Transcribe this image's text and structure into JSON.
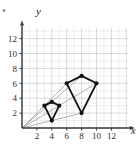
{
  "figure": {
    "corner_dot": "bullet-marker",
    "axis": {
      "x_label": "x",
      "y_label": "y",
      "x_ticks": [
        2,
        4,
        6,
        8,
        10,
        12
      ],
      "y_ticks": [
        2,
        4,
        6,
        8,
        10,
        12
      ],
      "x_range": [
        0,
        14
      ],
      "y_range": [
        0,
        13.5
      ],
      "grid": true,
      "grid_minor_step": 1,
      "grid_major_step": 2,
      "axis_color": "#3a3a3a",
      "grid_color": "#d8dde4",
      "grid_major_color": "#c3cad3",
      "ray_color": "#9a9a9a",
      "shape_color": "#111111"
    }
  },
  "chart_data": {
    "type": "scatter",
    "title": "",
    "xlabel": "x",
    "ylabel": "y",
    "xlim": [
      0,
      14
    ],
    "ylim": [
      0,
      13.5
    ],
    "grid": true,
    "legend": "none",
    "series": [
      {
        "name": "preimage-quadrilateral",
        "closed": true,
        "points": [
          [
            3,
            3
          ],
          [
            4,
            3.5
          ],
          [
            5,
            3
          ],
          [
            4,
            1
          ]
        ],
        "marker": "filled-circle"
      },
      {
        "name": "image-quadrilateral",
        "closed": true,
        "points": [
          [
            6,
            6
          ],
          [
            8,
            7
          ],
          [
            10,
            6
          ],
          [
            8,
            2
          ]
        ],
        "marker": "filled-circle"
      }
    ],
    "rays_from_origin": [
      {
        "name": "ray-to-6-6",
        "from": [
          0,
          0
        ],
        "to": [
          6,
          6
        ]
      },
      {
        "name": "ray-to-8-7",
        "from": [
          0,
          0
        ],
        "to": [
          8,
          7
        ]
      },
      {
        "name": "ray-to-10-6",
        "from": [
          0,
          0
        ],
        "to": [
          10,
          6
        ]
      },
      {
        "name": "ray-to-8-2",
        "from": [
          0,
          0
        ],
        "to": [
          8,
          2
        ]
      }
    ],
    "annotations": []
  }
}
